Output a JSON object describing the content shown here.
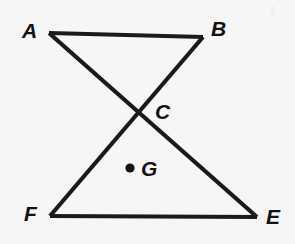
{
  "figure": {
    "background_color": "#f6f6f6",
    "line_color": "#1a1a1a",
    "label_color": "#121212",
    "line_width": 4.2,
    "canvas": {
      "width": 295,
      "height": 244
    },
    "vertices": [
      {
        "id": "A",
        "label": "A",
        "x": 49,
        "y": 33,
        "label_x": 22,
        "label_y": 38
      },
      {
        "id": "B",
        "label": "B",
        "x": 203,
        "y": 37,
        "label_x": 211,
        "label_y": 36
      },
      {
        "id": "C",
        "label": "C",
        "x": 133,
        "y": 111,
        "label_x": 155,
        "label_y": 119
      },
      {
        "id": "G",
        "label": "G",
        "x": 130,
        "y": 168,
        "label_x": 141,
        "label_y": 176
      },
      {
        "id": "F",
        "label": "F",
        "x": 50,
        "y": 216,
        "label_x": 24,
        "label_y": 221
      },
      {
        "id": "E",
        "label": "E",
        "x": 257,
        "y": 217,
        "label_x": 266,
        "label_y": 224
      }
    ],
    "segments": [
      {
        "name": "segment-AB",
        "from": "A",
        "to": "B"
      },
      {
        "name": "segment-AE",
        "from": "A",
        "to": "E"
      },
      {
        "name": "segment-BF",
        "from": "B",
        "to": "F"
      },
      {
        "name": "segment-FE",
        "from": "F",
        "to": "E"
      }
    ],
    "marked_points": [
      {
        "id": "G",
        "label": "G",
        "x": 130,
        "y": 168,
        "radius": 4.6
      }
    ]
  }
}
